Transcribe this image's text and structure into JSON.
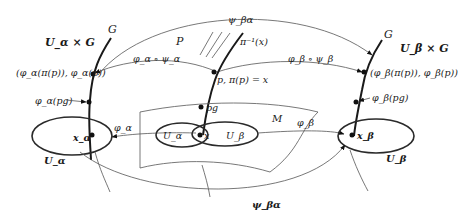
{
  "diagram": {
    "labels": {
      "G_left": "G",
      "G_right": "G",
      "U_alpha_x_G": "U_α × G",
      "U_beta_x_G": "U_β × G",
      "point_left": "(φ_α(π(p)), φ_α(p))",
      "point_right": "(φ_β(π(p)), φ_β(p))",
      "phi_alpha_pg": "φ_α(pg)",
      "phi_beta_pg": "φ_β(pg)",
      "x_alpha": "x_α",
      "x_beta": "x_β",
      "U_alpha_chart": "U_α",
      "U_beta_chart": "U_β",
      "phi_alpha_arrow": "φ_α",
      "phi_beta_arrow": "φ_β",
      "psi_ba_top": "ψ_βα",
      "psi_ba_bottom": "ψ_βα",
      "comp_alpha": "φ_α ∘ ψ_α",
      "comp_beta": "φ_β ∘ ψ_β",
      "P": "P",
      "fiber": "π⁻¹(x)",
      "p_point": "p, π(p) = x",
      "pg": "pg",
      "M": "M",
      "U_alpha_M": "U_α",
      "U_beta_M": "U_β",
      "x": "x"
    },
    "nodes": [
      {
        "id": "left-fiber",
        "label": "G"
      },
      {
        "id": "center-fiber",
        "label": "π⁻¹(x)"
      },
      {
        "id": "right-fiber",
        "label": "G"
      },
      {
        "id": "manifold",
        "label": "M"
      }
    ],
    "edges": [
      {
        "from": "center-fiber",
        "to": "left-fiber",
        "label": "φ_α ∘ ψ_α"
      },
      {
        "from": "center-fiber",
        "to": "right-fiber",
        "label": "φ_β ∘ ψ_β"
      },
      {
        "from": "left-fiber",
        "to": "right-fiber",
        "label": "ψ_βα"
      },
      {
        "from": "manifold",
        "to": "left-chart",
        "label": "φ_α"
      },
      {
        "from": "manifold",
        "to": "right-chart",
        "label": "φ_β"
      }
    ]
  }
}
